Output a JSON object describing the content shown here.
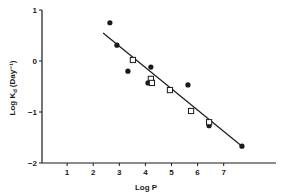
{
  "chart_data": {
    "type": "scatter",
    "title": "",
    "xlabel": "Log P",
    "ylabel": "Log K_d (Day⁻¹)",
    "ylabel_main": "Log K",
    "ylabel_sub": "d",
    "ylabel_unit": "(Day⁻¹)",
    "xlim": [
      0,
      8.9
    ],
    "ylim": [
      -2,
      1
    ],
    "xticks": [
      1,
      2,
      3,
      4,
      5,
      6,
      7
    ],
    "yticks": [
      1,
      0,
      -1,
      -2
    ],
    "ytick_labels": [
      "1",
      "0",
      "−1",
      "−2"
    ],
    "grid": false,
    "legend": null,
    "series": [
      {
        "name": "filled circles",
        "marker": "filled-circle",
        "points": [
          [
            2.64,
            0.75
          ],
          [
            2.91,
            0.31
          ],
          [
            3.33,
            -0.2
          ],
          [
            4.21,
            -0.12
          ],
          [
            4.1,
            -0.43
          ],
          [
            5.63,
            -0.47
          ],
          [
            6.44,
            -1.27
          ],
          [
            7.7,
            -1.67
          ]
        ]
      },
      {
        "name": "open squares",
        "marker": "open-square",
        "points": [
          [
            3.52,
            0.02
          ],
          [
            4.21,
            -0.35
          ],
          [
            4.25,
            -0.43
          ],
          [
            4.94,
            -0.57
          ],
          [
            5.75,
            -0.98
          ],
          [
            6.44,
            -1.2
          ]
        ]
      }
    ],
    "regression_line": {
      "x": [
        2.38,
        7.7
      ],
      "y": [
        0.55,
        -1.67
      ]
    }
  },
  "colors": {
    "ink": "#1a1a1a",
    "background": "#ffffff"
  }
}
